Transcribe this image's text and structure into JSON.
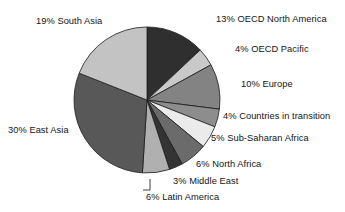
{
  "chart_data": {
    "type": "pie",
    "title": "",
    "subtitle": "",
    "xlabel": "",
    "ylabel": "",
    "legend_position": "none",
    "grid": false,
    "units": "percent",
    "start_angle_deg": 0,
    "direction": "clockwise",
    "categories": [
      "OECD North America",
      "OECD Pacific",
      "Europe",
      "Countries in transition",
      "Sub-Saharan Africa",
      "North Africa",
      "Middle East",
      "Latin America",
      "East Asia",
      "South Asia"
    ],
    "values": [
      13,
      4,
      10,
      4,
      5,
      6,
      3,
      6,
      30,
      19
    ],
    "colors": [
      "#2f2f2f",
      "#c9c9c9",
      "#838383",
      "#8d8d8d",
      "#ebebeb",
      "#6b6b6b",
      "#343434",
      "#b0b0b0",
      "#585858",
      "#c3c3c3"
    ],
    "slices": [
      {
        "label": "OECD North America",
        "value": 13,
        "value_text": "13%",
        "full_label": "13% OECD North America",
        "color": "#2f2f2f"
      },
      {
        "label": "OECD Pacific",
        "value": 4,
        "value_text": "4%",
        "full_label": "4% OECD Pacific",
        "color": "#c9c9c9"
      },
      {
        "label": "Europe",
        "value": 10,
        "value_text": "10%",
        "full_label": "10% Europe",
        "color": "#838383"
      },
      {
        "label": "Countries in transition",
        "value": 4,
        "value_text": "4%",
        "full_label": "4% Countries in transition",
        "color": "#8d8d8d"
      },
      {
        "label": "Sub-Saharan Africa",
        "value": 5,
        "value_text": "5%",
        "full_label": "5% Sub-Saharan Africa",
        "color": "#ebebeb"
      },
      {
        "label": "North Africa",
        "value": 6,
        "value_text": "6%",
        "full_label": "6% North Africa",
        "color": "#6b6b6b"
      },
      {
        "label": "Middle East",
        "value": 3,
        "value_text": "3%",
        "full_label": "3% Middle East",
        "color": "#343434"
      },
      {
        "label": "Latin America",
        "value": 6,
        "value_text": "6%",
        "full_label": "6% Latin America",
        "color": "#b0b0b0"
      },
      {
        "label": "East Asia",
        "value": 30,
        "value_text": "30%",
        "full_label": "30% East Asia",
        "color": "#585858"
      },
      {
        "label": "South Asia",
        "value": 19,
        "value_text": "19%",
        "full_label": "19% South Asia",
        "color": "#c3c3c3"
      }
    ]
  },
  "labels": {
    "oecd_north_america": "13% OECD North America",
    "oecd_pacific": "4% OECD Pacific",
    "europe": "10% Europe",
    "countries_in_transition": "4% Countries in transition",
    "sub_saharan_africa": "5% Sub-Saharan Africa",
    "north_africa": "6% North Africa",
    "middle_east": "3% Middle East",
    "latin_america": "6% Latin America",
    "east_asia": "30% East Asia",
    "south_asia": "19% South Asia"
  }
}
